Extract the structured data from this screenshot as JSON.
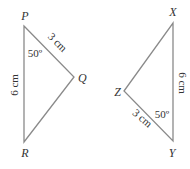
{
  "triangles": [
    {
      "name": "PQR",
      "vertices": {
        "a": "P",
        "b": "Q",
        "c": "R"
      },
      "side_ab": "3 cm",
      "side_ac": "6 cm",
      "angle_a": "50º"
    },
    {
      "name": "XYZ",
      "vertices": {
        "a": "X",
        "b": "Y",
        "c": "Z"
      },
      "side_ab": "6 cm",
      "side_bc": "3 cm",
      "angle_b": "50º"
    }
  ],
  "colors": {
    "edge": "#8a8a8a",
    "text": "#333333"
  }
}
